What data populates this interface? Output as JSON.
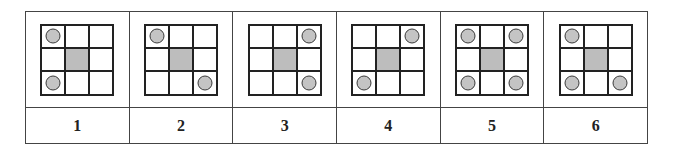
{
  "figure": {
    "colors": {
      "grid_line": "#222222",
      "center_fill": "#bdbdbd",
      "circle_fill": "#c4c4c4",
      "circle_stroke": "#3a3a3a",
      "table_border": "#444444",
      "background": "#ffffff"
    },
    "options": [
      {
        "label": "1",
        "circles": [
          "top-left",
          "bottom-left"
        ]
      },
      {
        "label": "2",
        "circles": [
          "top-left",
          "bottom-right"
        ]
      },
      {
        "label": "3",
        "circles": [
          "top-right",
          "bottom-right"
        ]
      },
      {
        "label": "4",
        "circles": [
          "top-right",
          "bottom-left"
        ]
      },
      {
        "label": "5",
        "circles": [
          "top-left",
          "top-right",
          "bottom-left",
          "bottom-right"
        ]
      },
      {
        "label": "6",
        "circles": [
          "top-left",
          "bottom-left",
          "bottom-right"
        ]
      }
    ]
  }
}
